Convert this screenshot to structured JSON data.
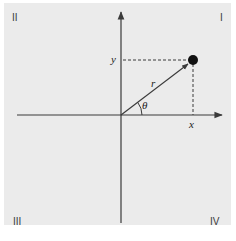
{
  "diagram": {
    "type": "polar-coordinates",
    "background_color": "#ebebeb",
    "line_color": "#3a3a3a",
    "point_color": "#111111",
    "quadrants": {
      "q1": "I",
      "q2": "II",
      "q3": "III",
      "q4": "IV"
    },
    "axes": {
      "x_label": "x",
      "y_label": "y"
    },
    "vector": {
      "label": "r",
      "angle_label": "θ"
    }
  }
}
